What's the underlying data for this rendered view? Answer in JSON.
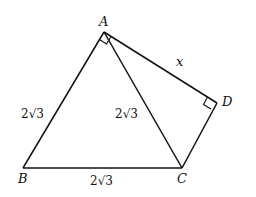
{
  "diagram": {
    "type": "geometry",
    "points": {
      "A": {
        "label": "A",
        "x": 104,
        "y": 32
      },
      "B": {
        "label": "B",
        "x": 23,
        "y": 168
      },
      "C": {
        "label": "C",
        "x": 182,
        "y": 168
      },
      "D": {
        "label": "D",
        "x": 217,
        "y": 103
      }
    },
    "segments": [
      {
        "from": "A",
        "to": "B",
        "label": "2√3"
      },
      {
        "from": "A",
        "to": "C",
        "label": "2√3"
      },
      {
        "from": "B",
        "to": "C",
        "label": "2√3"
      },
      {
        "from": "A",
        "to": "D",
        "label": "x"
      },
      {
        "from": "C",
        "to": "D",
        "label": ""
      }
    ],
    "right_angles": [
      "A",
      "D"
    ],
    "labels": {
      "A": "A",
      "B": "B",
      "C": "C",
      "D": "D",
      "ab": "2√3",
      "ac": "2√3",
      "bc": "2√3",
      "ad": "x"
    }
  }
}
